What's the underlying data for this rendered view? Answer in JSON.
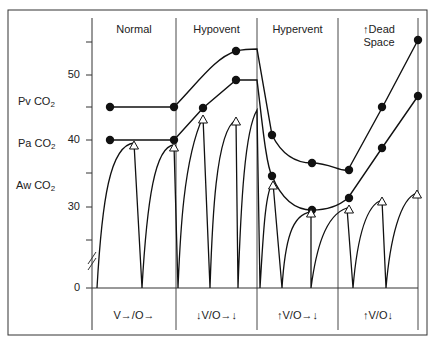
{
  "chart_data": {
    "type": "line",
    "title": "",
    "xlabel": "",
    "ylabel": "CO2",
    "ylim": [
      0,
      57
    ],
    "y_break": true,
    "yticks": [
      0,
      30,
      40,
      50
    ],
    "ytick_labels": [
      "0",
      "30",
      "40",
      "50"
    ],
    "minor_yticks": [
      35,
      45,
      55
    ],
    "grid": false,
    "legend": "none",
    "series_labels": [
      {
        "key": "pv",
        "text": "Pv CO",
        "sub": "2"
      },
      {
        "key": "pa",
        "text": "Pa CO",
        "sub": "2"
      },
      {
        "key": "aw",
        "text": "Aw CO",
        "sub": "2"
      }
    ],
    "regions": [
      {
        "title": "Normal",
        "title2": "",
        "footer": "V→/O→"
      },
      {
        "title": "Hypovent",
        "title2": "",
        "footer": "↓V/O→↓"
      },
      {
        "title": "Hypervent",
        "title2": "",
        "footer": "↑V/O→↓"
      },
      {
        "title": "↑Dead",
        "title2": "Space",
        "footer": "↑V/O↓"
      }
    ],
    "series": [
      {
        "name": "Pv CO2",
        "marker": "filled-circle",
        "points": [
          [
            1.2,
            45
          ],
          [
            2.0,
            45
          ],
          [
            2.8,
            53.5
          ],
          [
            3.8,
            41
          ],
          [
            4.3,
            33.5
          ],
          [
            4.8,
            35.5
          ],
          [
            5.3,
            45
          ],
          [
            5.8,
            55
          ]
        ]
      },
      {
        "name": "Pa CO2",
        "marker": "filled-circle",
        "points": [
          [
            1.2,
            40
          ],
          [
            2.0,
            40
          ],
          [
            2.35,
            45
          ],
          [
            2.8,
            49
          ],
          [
            3.8,
            35
          ],
          [
            4.3,
            30
          ],
          [
            4.8,
            32
          ],
          [
            5.3,
            39
          ],
          [
            5.8,
            47
          ]
        ]
      },
      {
        "name": "Aw CO2 (end-tidal peaks)",
        "marker": "open-triangle",
        "points": [
          [
            1.5,
            39.5
          ],
          [
            2.0,
            39
          ],
          [
            2.35,
            43.5
          ],
          [
            2.8,
            48
          ],
          [
            3.8,
            33.5
          ],
          [
            4.3,
            29.5
          ],
          [
            4.8,
            30
          ],
          [
            5.3,
            31
          ],
          [
            5.8,
            32.5
          ]
        ]
      }
    ]
  },
  "geometry": {
    "pv_path": "M110,107 L174,107 C200,80 215,58 236,51 C245,49 252,49 257,49 L272,135 C282,155 295,163 312,163 C330,163 340,172 348,170 L382,108 L418,40",
    "pa_path": "M110,140 L174,140 L203,108 L236,80 L257,80 C262,120 266,165 272,176 C282,200 295,210 312,210 C330,210 340,205 348,198 L382,148 L418,96",
    "aw_path": "M97,288 C102,200 110,145 134,143 L142,288 C147,200 155,146 174,145 L178,288 C180,240 183,160 203,117 L210,288 C212,230 215,130 236,120 L238,288 C241,200 245,130 257,110 L260,288 M260,288 C263,240 265,190 273,183 L282,288 C285,240 292,214 311,212 L311,288 C316,250 325,215 347,208 L353,288 C357,240 365,205 382,200 L386,288 C390,240 400,198 417,193",
    "pv_dots": [
      [
        110,
        107
      ],
      [
        174,
        107
      ],
      [
        236,
        51
      ],
      [
        272,
        135
      ],
      [
        312,
        163
      ],
      [
        349,
        170
      ],
      [
        382,
        107
      ],
      [
        418,
        40
      ]
    ],
    "pa_dots": [
      [
        110,
        140
      ],
      [
        174,
        140
      ],
      [
        203,
        108
      ],
      [
        236,
        80
      ],
      [
        272,
        176
      ],
      [
        312,
        210
      ],
      [
        349,
        198
      ],
      [
        382,
        148
      ],
      [
        418,
        96
      ]
    ],
    "aw_tris": [
      [
        134,
        145
      ],
      [
        174,
        147
      ],
      [
        203,
        119
      ],
      [
        236,
        121
      ],
      [
        273,
        185
      ],
      [
        311,
        213
      ],
      [
        349,
        209
      ],
      [
        382,
        201
      ],
      [
        417,
        194
      ]
    ]
  }
}
